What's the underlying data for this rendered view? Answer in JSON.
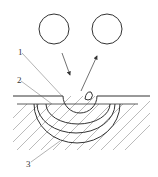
{
  "diagram": {
    "type": "erosion-impact-schematic",
    "labels": [
      {
        "id": "1",
        "text": "1",
        "x": 18,
        "y": 55,
        "target": "crater"
      },
      {
        "id": "2",
        "text": "2",
        "x": 17,
        "y": 83,
        "target": "inner-layer"
      },
      {
        "id": "3",
        "text": "3",
        "x": 26,
        "y": 167,
        "target": "deformation-zones"
      }
    ],
    "particles": [
      {
        "name": "incoming-particle",
        "cx": 54,
        "cy": 29,
        "r": 15
      },
      {
        "name": "rebound-particle",
        "cx": 107,
        "cy": 29,
        "r": 15
      }
    ],
    "arrows": [
      {
        "name": "incident-arrow",
        "x1": 62,
        "y1": 53,
        "x2": 70,
        "y2": 75
      },
      {
        "name": "rebound-arrow",
        "x1": 81,
        "y1": 91,
        "x2": 97,
        "y2": 56
      }
    ],
    "colors": {
      "stroke": "#333333",
      "hatch": "#777777",
      "background": "#ffffff"
    }
  }
}
